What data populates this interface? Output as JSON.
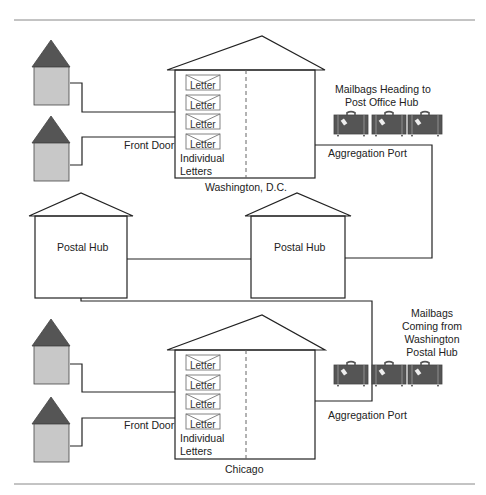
{
  "diagram": {
    "colors": {
      "line": "#222222",
      "house_roof": "#555555",
      "house_body": "#c8c8c8",
      "mailbag": "#555555",
      "background": "#ffffff",
      "letter_border": "#666666"
    },
    "washington": {
      "city_label": "Washington, D.C.",
      "front_door_label": "Front Door",
      "individual_letters_label_line1": "Individual",
      "individual_letters_label_line2": "Letters",
      "letters": [
        "Letter",
        "Letter",
        "Letter",
        "Letter"
      ],
      "aggregation_port_label": "Aggregation Port",
      "mailbags_label_line1": "Mailbags Heading to",
      "mailbags_label_line2": "Post Office Hub"
    },
    "hubs": [
      {
        "label": "Postal Hub"
      },
      {
        "label": "Postal Hub"
      }
    ],
    "chicago": {
      "city_label": "Chicago",
      "front_door_label": "Front Door",
      "individual_letters_label_line1": "Individual",
      "individual_letters_label_line2": "Letters",
      "letters": [
        "Letter",
        "Letter",
        "Letter",
        "Letter"
      ],
      "aggregation_port_label": "Aggregation Port",
      "mailbags_label_line1": "Mailbags",
      "mailbags_label_line2": "Coming from",
      "mailbags_label_line3": "Washington",
      "mailbags_label_line4": "Postal Hub"
    }
  }
}
